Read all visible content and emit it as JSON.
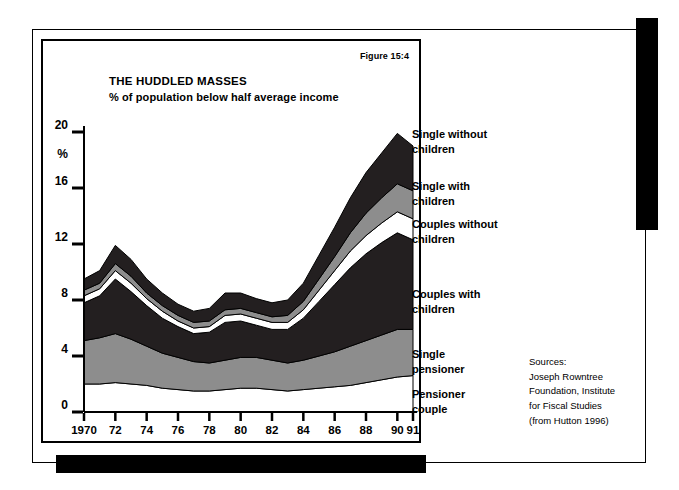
{
  "figure": {
    "label": "Figure 15:4",
    "title": "THE HUDDLED MASSES",
    "subtitle": "% of population below half average income"
  },
  "sources": {
    "text": "Sources:\nJoseph Rowntree\nFoundation, Institute\nfor Fiscal Studies\n(from Hutton 1996)"
  },
  "legend": {
    "items": [
      {
        "label": "Single without\nchildren",
        "color": "#231f20",
        "top": 88
      },
      {
        "label": "Single with\nchildren",
        "color": "#8d8d8d",
        "top": 140
      },
      {
        "label": "Couples without\nchildren",
        "color": "#ffffff",
        "top": 178
      },
      {
        "label": "Couples with\nchildren",
        "color": "#231f20",
        "top": 248
      },
      {
        "label": "Single\npensioner",
        "color": "#8d8d8d",
        "top": 308
      },
      {
        "label": "Pensioner\ncouple",
        "color": "#ffffff",
        "top": 348
      }
    ]
  },
  "chart_data": {
    "type": "area",
    "stacked": true,
    "title": "THE HUDDLED MASSES",
    "subtitle": "% of population below half average income",
    "xlabel": "",
    "ylabel": "%",
    "ylim": [
      0,
      20
    ],
    "yticks": [
      0,
      4,
      8,
      12,
      16,
      20
    ],
    "ytick_labels": [
      "0",
      "4",
      "8",
      "12",
      "16",
      "20"
    ],
    "grid": false,
    "legend_position": "right",
    "x": [
      1970,
      1971,
      1972,
      1973,
      1974,
      1975,
      1976,
      1977,
      1978,
      1979,
      1980,
      1981,
      1982,
      1983,
      1984,
      1985,
      1986,
      1987,
      1988,
      1989,
      1990,
      1991
    ],
    "xtick_labels": [
      "1970",
      "72",
      "74",
      "76",
      "78",
      "80",
      "82",
      "84",
      "86",
      "88",
      "90",
      "91"
    ],
    "xtick_values": [
      1970,
      1972,
      1974,
      1976,
      1978,
      1980,
      1982,
      1984,
      1986,
      1988,
      1990,
      1991
    ],
    "series": [
      {
        "name": "Pensioner couple",
        "color": "#ffffff",
        "values": [
          2.0,
          2.0,
          2.1,
          2.0,
          1.9,
          1.7,
          1.6,
          1.5,
          1.5,
          1.6,
          1.7,
          1.7,
          1.6,
          1.5,
          1.6,
          1.7,
          1.8,
          1.9,
          2.1,
          2.3,
          2.5,
          2.6
        ]
      },
      {
        "name": "Single pensioner",
        "color": "#8d8d8d",
        "values": [
          3.1,
          3.3,
          3.5,
          3.2,
          2.8,
          2.5,
          2.3,
          2.1,
          2.0,
          2.1,
          2.2,
          2.2,
          2.1,
          2.0,
          2.1,
          2.3,
          2.5,
          2.8,
          3.0,
          3.2,
          3.4,
          3.3
        ]
      },
      {
        "name": "Couples with children",
        "color": "#231f20",
        "values": [
          2.7,
          3.0,
          3.9,
          3.4,
          2.9,
          2.5,
          2.2,
          2.0,
          2.2,
          2.7,
          2.6,
          2.3,
          2.2,
          2.4,
          3.0,
          3.9,
          4.8,
          5.6,
          6.2,
          6.6,
          6.9,
          6.4
        ]
      },
      {
        "name": "Couples without children",
        "color": "#ffffff",
        "values": [
          0.5,
          0.5,
          0.6,
          0.6,
          0.5,
          0.5,
          0.4,
          0.4,
          0.4,
          0.5,
          0.5,
          0.5,
          0.5,
          0.5,
          0.6,
          0.8,
          1.0,
          1.2,
          1.3,
          1.4,
          1.5,
          1.5
        ]
      },
      {
        "name": "Single with children",
        "color": "#8d8d8d",
        "values": [
          0.4,
          0.4,
          0.5,
          0.5,
          0.4,
          0.4,
          0.4,
          0.4,
          0.4,
          0.4,
          0.4,
          0.4,
          0.4,
          0.5,
          0.6,
          0.8,
          1.0,
          1.3,
          1.6,
          1.8,
          2.0,
          2.0
        ]
      },
      {
        "name": "Single without children",
        "color": "#231f20",
        "values": [
          0.8,
          0.9,
          1.3,
          1.2,
          1.0,
          0.9,
          0.8,
          0.8,
          0.9,
          1.2,
          1.1,
          1.0,
          1.0,
          1.1,
          1.3,
          1.7,
          2.1,
          2.5,
          2.9,
          3.2,
          3.6,
          3.2
        ]
      }
    ],
    "totals": [
      9.5,
      10.1,
      11.9,
      10.9,
      9.5,
      8.5,
      7.7,
      7.2,
      7.4,
      8.5,
      8.5,
      8.1,
      7.8,
      8.0,
      9.2,
      11.2,
      13.2,
      15.3,
      17.1,
      18.5,
      19.9,
      19.0
    ]
  }
}
